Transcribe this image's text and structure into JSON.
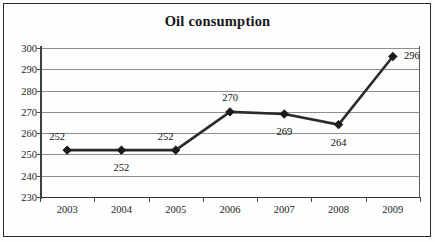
{
  "chart_data": {
    "type": "line",
    "title": "Oil consumption",
    "xlabel": "",
    "ylabel": "",
    "categories": [
      "2003",
      "2004",
      "2005",
      "2006",
      "2007",
      "2008",
      "2009"
    ],
    "values": [
      252,
      252,
      252,
      270,
      269,
      264,
      296
    ],
    "data_labels": [
      "252",
      "252",
      "252",
      "270",
      "269",
      "264",
      "296"
    ],
    "label_positions": [
      "above-left",
      "below",
      "above-left",
      "above",
      "below",
      "below",
      "right"
    ],
    "ylim": [
      230,
      300
    ],
    "y_ticks": [
      300,
      290,
      280,
      270,
      260,
      250,
      240,
      230
    ],
    "y_tick_labels": [
      "300",
      "290",
      "280",
      "270",
      "260",
      "250",
      "240",
      "230"
    ],
    "grid": true,
    "legend": false,
    "series": [
      {
        "name": "Oil consumption",
        "values": [
          252,
          252,
          252,
          270,
          269,
          264,
          296
        ],
        "marker": "diamond",
        "color": "#2b2b2b"
      }
    ],
    "colors": {
      "line": "#2b2b2b",
      "marker": "#1a1a1a",
      "gridline": "#8d8d8d",
      "axis": "#333333",
      "background": "#fefefe",
      "text": "#161616"
    }
  }
}
